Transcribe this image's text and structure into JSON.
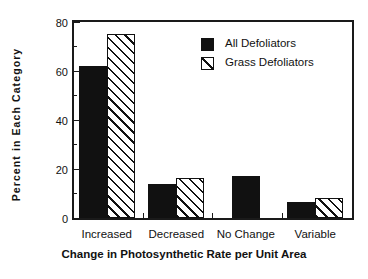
{
  "chart_data": {
    "type": "bar",
    "title": "",
    "xlabel": "Change in Photosynthetic Rate per Unit Area",
    "ylabel": "Percent  in  Each  Category",
    "categories": [
      "Increased",
      "Decreased",
      "No Change",
      "Variable"
    ],
    "series": [
      {
        "name": "All Defoliators",
        "style": "solid",
        "values": [
          62,
          14,
          17,
          6.5
        ]
      },
      {
        "name": "Grass Defoliators",
        "style": "hatched",
        "values": [
          75,
          16.5,
          null,
          8
        ]
      }
    ],
    "ylim": [
      0,
      80
    ],
    "yticks_major": [
      0,
      20,
      40,
      60,
      80
    ],
    "yticks_minor": [
      10,
      30,
      50,
      70
    ],
    "ytick_labels": [
      "0",
      "20",
      "40",
      "60",
      "80"
    ],
    "grid": false,
    "legend_position": "top-right",
    "colors": {
      "series_all_defoliators": "#111111",
      "series_grass_defoliators": "#ffffff",
      "axis": "#1a1a1a",
      "text": "#111111",
      "background": "#ffffff"
    }
  },
  "legend": {
    "entries": [
      {
        "label": "All Defoliators",
        "swatch": "solid-square-swatch"
      },
      {
        "label": "Grass Defoliators",
        "swatch": "hatched-square-swatch"
      }
    ]
  }
}
